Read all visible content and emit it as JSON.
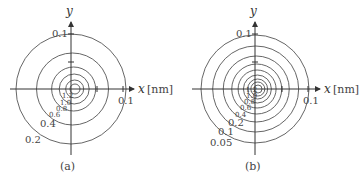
{
  "panels": [
    {
      "id": "a",
      "caption": "(a)",
      "x_axis_label": "x",
      "x_axis_unit": "[nm]",
      "y_axis_label": "y",
      "y_tick_label": "0.1",
      "x_tick_label": "0.1",
      "contour_labels": [
        "1.2",
        "1.0",
        "0.8",
        "0.6",
        "0.4",
        "0.2"
      ]
    },
    {
      "id": "b",
      "caption": "(b)",
      "x_axis_label": "x",
      "x_axis_unit": "[nm]",
      "y_axis_label": "y",
      "y_tick_label": "0.1",
      "x_tick_label": "0.1",
      "contour_labels": [
        "1.2",
        "1.0",
        "0.8",
        "0.6",
        "0.4",
        "0.2",
        "0.1",
        "0.05"
      ]
    }
  ]
}
